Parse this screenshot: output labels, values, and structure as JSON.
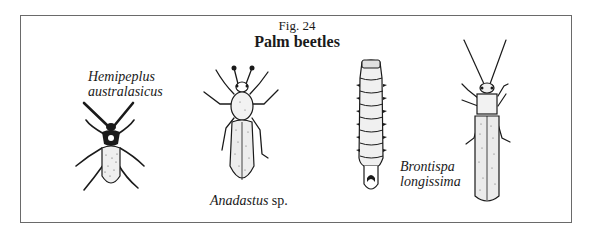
{
  "figure": {
    "number": "Fig. 24",
    "title": "Palm beetles"
  },
  "specimens": [
    {
      "id": "hemipeplus",
      "name_line1": "Hemipeplus",
      "name_line2": "australasicus",
      "stage": "adult"
    },
    {
      "id": "anadastus",
      "name_italic": "Anadastus",
      "name_roman": " sp.",
      "stage": "adult"
    },
    {
      "id": "larva",
      "stage": "larva"
    },
    {
      "id": "brontispa",
      "name_line1": "Brontispa",
      "name_line2": "longissima",
      "stage": "adult"
    }
  ],
  "colors": {
    "ink": "#1a1a1a",
    "border": "#6a6a6a",
    "stipple": "#e8e8e8"
  }
}
